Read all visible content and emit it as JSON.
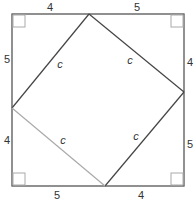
{
  "diagram": {
    "title": "",
    "outer_square": {
      "corners": {
        "tl": [
          12,
          14
        ],
        "tr": [
          184,
          14
        ],
        "br": [
          184,
          186
        ],
        "bl": [
          12,
          186
        ]
      },
      "color": "#555555"
    },
    "inner_square": {
      "vertices": {
        "top": [
          89,
          14
        ],
        "right": [
          184,
          92
        ],
        "bottom": [
          105,
          186
        ],
        "left": [
          12,
          108
        ]
      },
      "color": "#444444",
      "light_edge_color": "#aaaaaa"
    },
    "right_angle_marker_color": "#999999",
    "labels": {
      "top_left": "4",
      "top_right": "5",
      "right_top": "4",
      "right_bottom": "5",
      "bottom_right": "4",
      "bottom_left": "5",
      "left_bottom": "4",
      "left_top": "5",
      "hyp_top_left": "c",
      "hyp_top_right": "c",
      "hyp_bottom_right": "c",
      "hyp_bottom_left": "c"
    }
  }
}
